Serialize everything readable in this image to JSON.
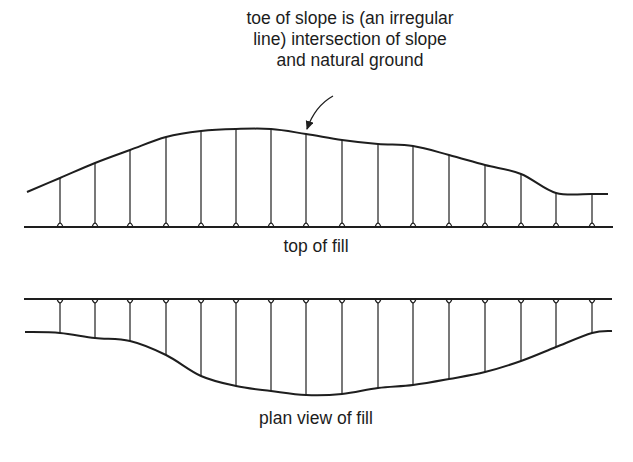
{
  "annotation": {
    "lines": [
      "toe of slope is (an irregular",
      "line) intersection of slope",
      "and natural ground"
    ],
    "arrow_from": [
      333,
      96
    ],
    "arrow_to": [
      307,
      129
    ]
  },
  "top_figure": {
    "caption": "top of fill",
    "baseline": {
      "x1": 24,
      "x2": 613,
      "y": 227
    },
    "verticals_x": [
      60,
      95,
      130,
      166,
      201,
      236,
      271,
      306,
      342,
      378,
      413,
      449,
      485,
      521,
      556,
      592
    ],
    "curve_y_at_verticals": [
      178,
      163,
      150,
      137,
      131,
      129,
      129,
      134,
      140,
      144,
      146,
      155,
      165,
      174,
      193,
      194
    ],
    "curve_start": [
      27,
      192
    ],
    "curve_end": [
      608,
      194
    ]
  },
  "bottom_figure": {
    "caption": "plan view of fill",
    "topline": {
      "x1": 24,
      "x2": 612,
      "y": 299
    },
    "verticals_x": [
      60,
      95,
      130,
      166,
      201,
      236,
      271,
      306,
      342,
      378,
      413,
      449,
      485,
      521,
      556,
      592
    ],
    "curve_y_at_verticals": [
      333,
      338,
      341,
      355,
      376,
      386,
      391,
      395,
      394,
      388,
      385,
      379,
      372,
      361,
      347,
      333
    ],
    "curve_start": [
      25,
      332
    ],
    "curve_end": [
      612,
      331
    ]
  },
  "colors": {
    "line": "#1e1e1e",
    "background": "#ffffff"
  }
}
